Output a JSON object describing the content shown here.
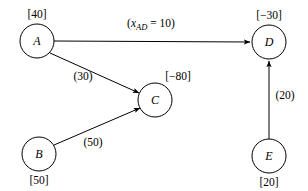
{
  "diagram": {
    "type": "minimum-cost-network-flow",
    "nodes": [
      {
        "id": "A",
        "letter": "A",
        "supply_label": "[40]",
        "supply_value": 40,
        "cx": 37,
        "cy": 41,
        "r": 17,
        "label_x": 37,
        "label_y": 18,
        "label_pos": "above"
      },
      {
        "id": "B",
        "letter": "B",
        "supply_label": "[50]",
        "supply_value": 50,
        "cx": 39,
        "cy": 154,
        "r": 17,
        "label_x": 39,
        "label_y": 184,
        "label_pos": "below"
      },
      {
        "id": "C",
        "letter": "C",
        "supply_label": "[−80]",
        "supply_value": -80,
        "cx": 155,
        "cy": 100,
        "r": 17,
        "label_x": 178,
        "label_y": 80,
        "label_pos": "above-right"
      },
      {
        "id": "D",
        "letter": "D",
        "supply_label": "[−30]",
        "supply_value": -30,
        "cx": 269,
        "cy": 42,
        "r": 17,
        "label_x": 269,
        "label_y": 19,
        "label_pos": "above"
      },
      {
        "id": "E",
        "letter": "E",
        "supply_label": "[20]",
        "supply_value": 20,
        "cx": 269,
        "cy": 156,
        "r": 17,
        "label_x": 269,
        "label_y": 186,
        "label_pos": "below"
      }
    ],
    "edges": [
      {
        "id": "A-D",
        "from": "A",
        "to": "D",
        "label_kind": "flow",
        "label_prefix": "(",
        "label_var": "x",
        "label_sub": "AD",
        "label_eq": " = ",
        "label_value": "10",
        "label_suffix": ")",
        "label_text": "(x_AD = 10)",
        "label_x": 151,
        "label_y": 27,
        "x1": 54,
        "y1": 41,
        "x2": 250,
        "y2": 42
      },
      {
        "id": "A-C",
        "from": "A",
        "to": "C",
        "label_kind": "cost",
        "label_text": "(30)",
        "label_x": 83,
        "label_y": 80,
        "x1": 50,
        "y1": 53,
        "x2": 139,
        "y2": 93
      },
      {
        "id": "B-C",
        "from": "B",
        "to": "C",
        "label_kind": "cost",
        "label_text": "(50)",
        "label_x": 93,
        "label_y": 146,
        "x1": 54,
        "y1": 145,
        "x2": 140,
        "y2": 108
      },
      {
        "id": "E-D",
        "from": "E",
        "to": "D",
        "label_kind": "cost",
        "label_text": "(20)",
        "label_x": 285,
        "label_y": 99,
        "x1": 269,
        "y1": 139,
        "x2": 269,
        "y2": 61
      }
    ],
    "colors": {
      "stroke": "#000000",
      "node_fill": "#ffffff",
      "background": "#ffffff",
      "text": "#000000"
    }
  }
}
